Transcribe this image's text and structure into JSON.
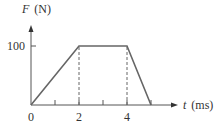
{
  "chart_data": {
    "type": "line",
    "title": "",
    "xlabel": "t (ms)",
    "xlabel_var": "t",
    "xlabel_unit": "(ms)",
    "ylabel": "F (N)",
    "ylabel_var": "F",
    "ylabel_unit": "(N)",
    "x_tick_labels": [
      "0",
      "2",
      "4"
    ],
    "x_ticks": [
      0,
      1,
      2,
      3,
      4,
      5
    ],
    "y_tick_labels": [
      "100"
    ],
    "y_ticks": [
      100
    ],
    "xlim": [
      0,
      6
    ],
    "ylim": [
      0,
      130
    ],
    "grid": false,
    "legend": null,
    "series": [
      {
        "name": "F(t)",
        "x": [
          0,
          2,
          4,
          5
        ],
        "y": [
          0,
          100,
          100,
          0
        ],
        "color": "#666666"
      }
    ],
    "annotations": [
      {
        "type": "dashed-vertical",
        "x": 2,
        "y_from": 0,
        "y_to": 100
      },
      {
        "type": "dashed-vertical",
        "x": 4,
        "y_from": 0,
        "y_to": 100
      }
    ]
  },
  "colors": {
    "line": "#666666",
    "axis": "#555555",
    "text": "#333333",
    "background": "#ffffff"
  }
}
